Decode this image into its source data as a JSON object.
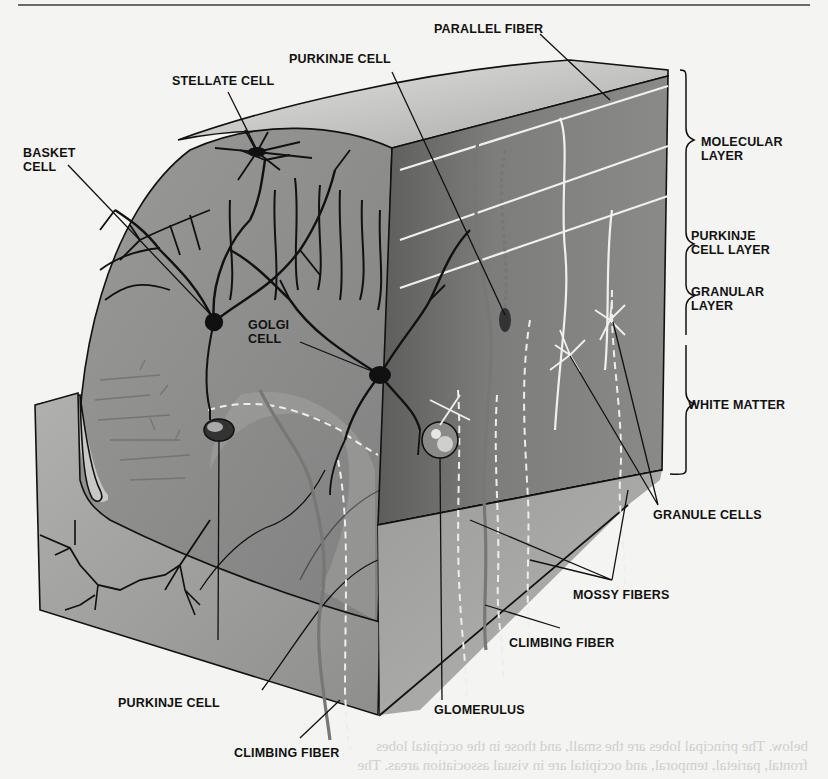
{
  "figure": {
    "labels": {
      "parallel_fiber": "PARALLEL FIBER",
      "purkinje_cell_top": "PURKINJE CELL",
      "stellate_cell": "STELLATE CELL",
      "basket_cell": "BASKET\nCELL",
      "golgi_cell": "GOLGI\nCELL",
      "purkinje_cell_bottom": "PURKINJE CELL",
      "glomerulus": "GLOMERULUS",
      "climbing_fiber_bottom": "CLIMBING FIBER",
      "climbing_fiber_right": "CLIMBING FIBER",
      "mossy_fibers": "MOSSY FIBERS",
      "granule_cells": "GRANULE CELLS"
    },
    "layers": [
      {
        "id": "molecular",
        "label": "MOLECULAR\nLAYER"
      },
      {
        "id": "purkinje",
        "label": "PURKINJE\nCELL LAYER"
      },
      {
        "id": "granular",
        "label": "GRANULAR\nLAYER"
      },
      {
        "id": "white_matter",
        "label": "WHITE MATTER"
      }
    ],
    "colors": {
      "paper": "#f4f4f2",
      "tissue_light": "#b9b9b7",
      "tissue_mid": "#8f8f8d",
      "tissue_dark": "#6e6e6c",
      "white_matter": "#a9a9a7",
      "ink": "#111111",
      "fiber_white": "#f0f0ee"
    }
  },
  "page_bleed": {
    "line1": "below. The principal lobes are the      small, and those in the occipital lobes",
    "line2": "frontal, parietal, temporal, and occipital    are in visual association areas. The"
  }
}
